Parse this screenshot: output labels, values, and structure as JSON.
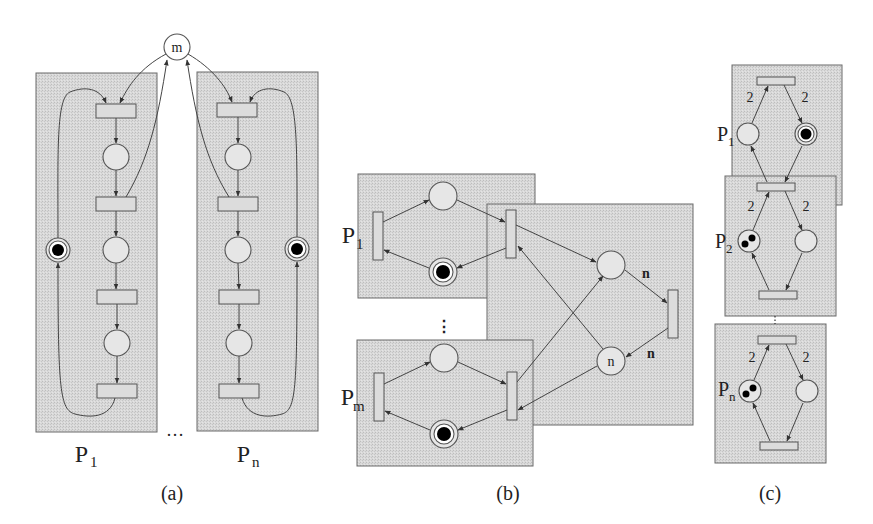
{
  "figure": {
    "panels": [
      {
        "id": "a",
        "caption": "(a)",
        "shared_place_label": "m",
        "process_labels": [
          {
            "base": "P",
            "sub": "1"
          },
          {
            "base": "P",
            "sub": "n"
          }
        ],
        "ellipsis": "…"
      },
      {
        "id": "b",
        "caption": "(b)",
        "process_labels": [
          {
            "base": "P",
            "sub": "1"
          },
          {
            "base": "P",
            "sub": "m"
          }
        ],
        "ellipsis": "⋮",
        "place_label": "n",
        "arc_weights": [
          "n",
          "n"
        ]
      },
      {
        "id": "c",
        "caption": "(c)",
        "process_labels": [
          {
            "base": "P",
            "sub": "1"
          },
          {
            "base": "P",
            "sub": "2"
          },
          {
            "base": "P",
            "sub": "n"
          }
        ],
        "ellipsis": "⋮",
        "arc_weight": "2"
      }
    ]
  },
  "colors": {
    "box_fill": "#d4d4d4",
    "stroke": "#555555",
    "token": "#000000"
  }
}
